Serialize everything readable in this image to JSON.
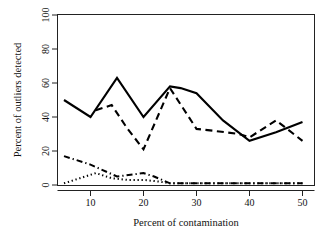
{
  "chart_data": {
    "type": "line",
    "title": "",
    "xlabel": "Percent of contamination",
    "ylabel": "Percent of outliers detected",
    "xlim": [
      4,
      51
    ],
    "ylim": [
      0,
      100
    ],
    "xticks": [
      10,
      20,
      30,
      40,
      50
    ],
    "yticks": [
      0,
      20,
      40,
      60,
      80,
      100
    ],
    "grid": false,
    "legend": "none",
    "series": [
      {
        "name": "solid-line",
        "style": "solid",
        "x": [
          5,
          10,
          15,
          20,
          25,
          27,
          30,
          35,
          40,
          45,
          50
        ],
        "values": [
          50,
          40,
          63,
          40,
          58,
          57,
          54,
          38,
          26,
          31,
          37
        ]
      },
      {
        "name": "dashed-line",
        "style": "dashed",
        "x": [
          11,
          14,
          17,
          20,
          25,
          30,
          33,
          38,
          40,
          45,
          50
        ],
        "values": [
          44,
          47,
          33,
          21,
          57,
          33,
          32,
          30,
          28,
          38,
          26
        ]
      },
      {
        "name": "dash-dot-line",
        "style": "dash-dot",
        "x": [
          5,
          10,
          15,
          20,
          22,
          25,
          30,
          35,
          40,
          45,
          50
        ],
        "values": [
          17,
          12,
          5,
          7,
          5,
          1,
          1,
          1,
          1,
          1,
          1
        ]
      },
      {
        "name": "dotted-line",
        "style": "dotted",
        "x": [
          5,
          8,
          11,
          14,
          17,
          20,
          23,
          25,
          30,
          35,
          40,
          45,
          50
        ],
        "values": [
          1,
          4,
          7,
          4,
          3,
          3,
          2,
          1,
          1,
          1,
          1,
          1,
          1
        ]
      }
    ]
  },
  "axes": {
    "x_tick_labels": [
      "10",
      "20",
      "30",
      "40",
      "50"
    ],
    "y_tick_labels": [
      "0",
      "20",
      "40",
      "60",
      "80",
      "100"
    ],
    "x_axis_title": "Percent of contamination",
    "y_axis_title": "Percent of outliers detected"
  }
}
